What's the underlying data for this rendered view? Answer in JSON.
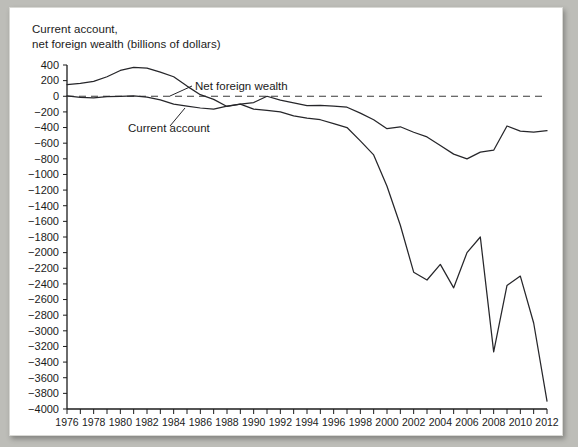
{
  "chart_data": {
    "type": "line",
    "title": "Current account,\nnet foreign wealth (billions of dollars)",
    "xlabel": "",
    "ylabel": "",
    "xlim": [
      1976,
      2012
    ],
    "ylim": [
      -4000,
      400
    ],
    "ytick_step": 200,
    "xtick_step": 2,
    "grid": false,
    "legend_position": "inline-annotations",
    "zero_reference_line": true,
    "x": [
      1976,
      1977,
      1978,
      1979,
      1980,
      1981,
      1982,
      1983,
      1984,
      1985,
      1986,
      1987,
      1988,
      1989,
      1990,
      1991,
      1992,
      1993,
      1994,
      1995,
      1996,
      1997,
      1998,
      1999,
      2000,
      2001,
      2002,
      2003,
      2004,
      2005,
      2006,
      2007,
      2008,
      2009,
      2010,
      2011,
      2012
    ],
    "ytick_labels": [
      "400",
      "200",
      "0",
      "-200",
      "-400",
      "-600",
      "-800",
      "-1000",
      "-1200",
      "-1400",
      "-1600",
      "-1800",
      "-2000",
      "-2200",
      "-2400",
      "-2600",
      "-2800",
      "-3000",
      "-3200",
      "-3400",
      "-3600",
      "-3800",
      "-4000"
    ],
    "xtick_labels": [
      "1976",
      "1978",
      "1980",
      "1982",
      "1984",
      "1986",
      "1988",
      "1990",
      "1992",
      "1994",
      "1996",
      "1998",
      "2000",
      "2002",
      "2004",
      "2006",
      "2008",
      "2010",
      "2012"
    ],
    "series": [
      {
        "name": "Net foreign wealth",
        "label": "Net foreign wealth",
        "color": "#26262a",
        "values": [
          150,
          165,
          190,
          250,
          330,
          370,
          360,
          310,
          250,
          130,
          20,
          -40,
          -130,
          -100,
          -165,
          -180,
          -200,
          -250,
          -280,
          -300,
          -350,
          -400,
          -570,
          -750,
          -1150,
          -1650,
          -2250,
          -2350,
          -2150,
          -2450,
          -2000,
          -1800,
          -3270,
          -2420,
          -2300,
          -2900,
          -3900
        ]
      },
      {
        "name": "Current account",
        "label": "Current account",
        "color": "#26262a",
        "values": [
          5,
          -15,
          -20,
          -5,
          0,
          5,
          -10,
          -45,
          -100,
          -125,
          -150,
          -165,
          -125,
          -100,
          -80,
          0,
          -50,
          -85,
          -120,
          -115,
          -125,
          -140,
          -215,
          -300,
          -415,
          -390,
          -460,
          -520,
          -630,
          -740,
          -800,
          -715,
          -690,
          -380,
          -445,
          -460,
          -440
        ]
      }
    ],
    "annotations": [
      {
        "text": "Net foreign wealth",
        "near_year": 1986
      },
      {
        "text": "Current account",
        "near_year": 1983
      }
    ]
  }
}
